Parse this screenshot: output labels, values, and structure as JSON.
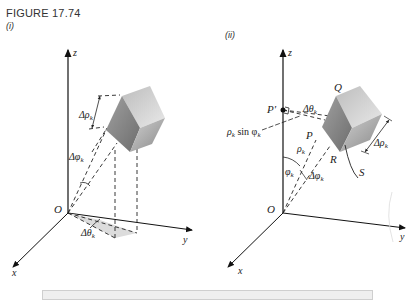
{
  "figure": {
    "caption": "FIGURE 17.74",
    "panels": [
      {
        "label": "(i)",
        "axes": {
          "z": "z",
          "y": "y",
          "x": "x",
          "origin": "O"
        },
        "annotations": {
          "delta_rho": "Δρ",
          "delta_rho_sub": "k",
          "delta_phi": "Δφ",
          "delta_phi_sub": "k",
          "delta_theta": "Δθ",
          "delta_theta_sub": "k"
        }
      },
      {
        "label": "(ii)",
        "axes": {
          "z": "z",
          "y": "y",
          "x": "x",
          "origin": "O"
        },
        "points": {
          "P_prime": "P′",
          "P": "P",
          "Q": "Q",
          "R": "R",
          "S": "S"
        },
        "annotations": {
          "rho_sin_phi": "ρ",
          "rho_sin_phi_sub": "k",
          "rho_sin_phi_mid": " sin φ",
          "rho_sin_phi_sub2": "k",
          "delta_theta": "Δθ",
          "delta_theta_sub": "k",
          "rho": "ρ",
          "rho_sub": "k",
          "phi": "φ",
          "phi_sub": "k",
          "delta_phi": "Δφ",
          "delta_phi_sub": "k",
          "delta_rho": "Δρ",
          "delta_rho_sub": "k"
        }
      }
    ]
  }
}
